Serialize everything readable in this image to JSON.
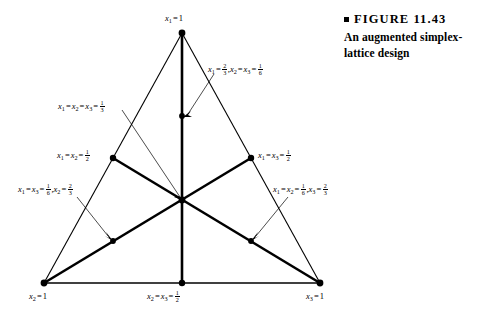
{
  "caption": {
    "marker": "square-bullet",
    "figure_label": "FIGURE 11.43",
    "description": "An augmented simplex-lattice design"
  },
  "diagram": {
    "type": "augmented-simplex-lattice-ternary",
    "vertices": [
      {
        "id": "apex",
        "label_text": "x1 = 1",
        "x": 182,
        "y": 33,
        "composition": {
          "x1": 1,
          "x2": 0,
          "x3": 0
        }
      },
      {
        "id": "bottom-left",
        "label_text": "x2 = 1",
        "x": 44,
        "y": 283,
        "composition": {
          "x1": 0,
          "x2": 1,
          "x3": 0
        }
      },
      {
        "id": "bottom-right",
        "label_text": "x3 = 1",
        "x": 320,
        "y": 283,
        "composition": {
          "x1": 0,
          "x2": 0,
          "x3": 1
        }
      }
    ],
    "edge_midpoints": [
      {
        "id": "left-edge-mid",
        "label_text": "x1 = x2 = 1/2",
        "x": 113,
        "y": 158
      },
      {
        "id": "right-edge-mid",
        "label_text": "x1 = x3 = 1/2",
        "x": 251,
        "y": 158
      },
      {
        "id": "bottom-edge-mid",
        "label_text": "x2 = x3 = 1/2",
        "x": 182,
        "y": 283
      }
    ],
    "centroid": {
      "id": "centroid",
      "label_text": "x1 = x2 = x3 = 1/3",
      "x": 182,
      "y": 200
    },
    "axial_points": [
      {
        "id": "axial-top",
        "label_text": "x1 = 2/3, x2 = x3 = 1/6",
        "x": 182,
        "y": 116
      },
      {
        "id": "axial-lower-left",
        "label_text": "x1 = x3 = 1/6, x2 = 2/3",
        "x": 113,
        "y": 241
      },
      {
        "id": "axial-lower-right",
        "label_text": "x1 = x2 = 1/6, x3 = 2/3",
        "x": 251,
        "y": 241
      }
    ]
  },
  "labels": {
    "apex": {
      "var1": "x",
      "sub1": "1",
      "value": "1"
    },
    "bottom_left": {
      "var1": "x",
      "sub1": "2",
      "value": "1"
    },
    "bottom_right": {
      "var1": "x",
      "sub1": "3",
      "value": "1"
    },
    "bottom_mid": {
      "var1": "x",
      "sub1": "2",
      "var2": "x",
      "sub2": "3",
      "num": "1",
      "den": "2"
    },
    "left_mid": {
      "var1": "x",
      "sub1": "1",
      "var2": "x",
      "sub2": "2",
      "num": "1",
      "den": "2"
    },
    "right_mid": {
      "var1": "x",
      "sub1": "1",
      "var2": "x",
      "sub2": "3",
      "num": "1",
      "den": "2"
    },
    "centroid": {
      "var1": "x",
      "sub1": "1",
      "var2": "x",
      "sub2": "2",
      "var3": "x",
      "sub3": "3",
      "num": "1",
      "den": "3"
    },
    "axial_top": {
      "var1": "x",
      "sub1": "1",
      "num1": "2",
      "den1": "3",
      "var2": "x",
      "sub2": "2",
      "var3": "x",
      "sub3": "3",
      "num2": "1",
      "den2": "6"
    },
    "axial_left": {
      "var1": "x",
      "sub1": "1",
      "var2": "x",
      "sub2": "3",
      "num1": "1",
      "den1": "6",
      "var3": "x",
      "sub3": "2",
      "num2": "2",
      "den2": "3"
    },
    "axial_right": {
      "var1": "x",
      "sub1": "1",
      "var2": "x",
      "sub2": "2",
      "num1": "1",
      "den1": "6",
      "var3": "x",
      "sub3": "3",
      "num2": "2",
      "den2": "3"
    }
  },
  "style": {
    "stroke_color": "#000000",
    "point_color": "#000000",
    "background": "#ffffff"
  }
}
